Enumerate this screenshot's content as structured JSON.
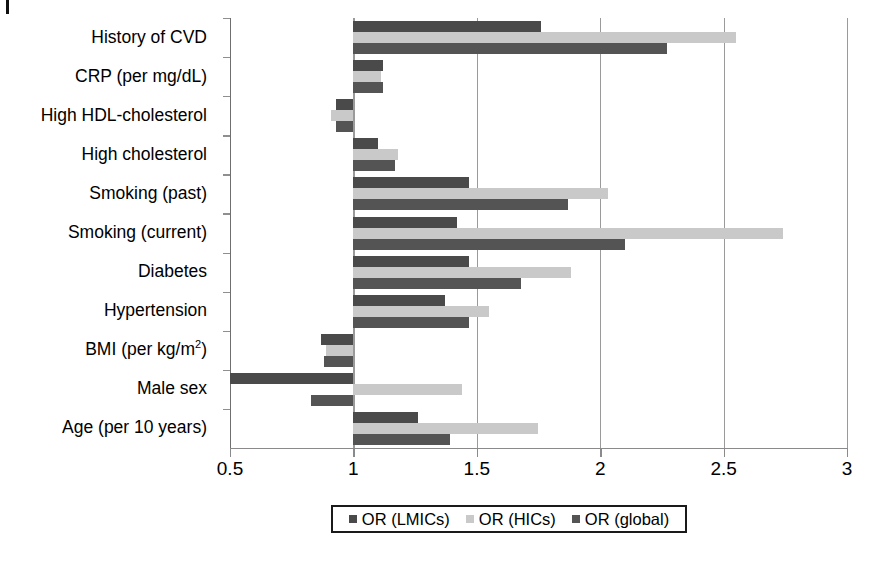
{
  "figure": {
    "corner_mark": "page-edge-mark"
  },
  "chart_data": {
    "type": "bar",
    "orientation": "horizontal",
    "title": "",
    "xlabel": "",
    "ylabel": "",
    "xlim": [
      0.5,
      3
    ],
    "xticks": [
      0.5,
      1,
      1.5,
      2,
      2.5,
      3
    ],
    "xtick_labels": [
      "0.5",
      "1",
      "1.5",
      "2",
      "2.5",
      "3"
    ],
    "reference_line": 1,
    "grid": "vertical",
    "legend_position": "bottom",
    "categories": [
      "History of CVD",
      "CRP (per mg/dL)",
      "High HDL-cholesterol",
      "High cholesterol",
      "Smoking (past)",
      "Smoking (current)",
      "Diabetes",
      "Hypertension",
      "BMI (per kg/m2)",
      "Male sex",
      "Age (per 10 years)"
    ],
    "series": [
      {
        "name": "OR (LMICs)",
        "color": "#4a4a4a",
        "values": [
          1.76,
          1.12,
          0.93,
          1.1,
          1.47,
          1.42,
          1.47,
          1.37,
          0.87,
          0.5,
          1.26
        ]
      },
      {
        "name": "OR (HICs)",
        "color": "#c9c9c9",
        "values": [
          2.55,
          1.11,
          0.91,
          1.18,
          2.03,
          2.74,
          1.88,
          1.55,
          0.89,
          1.44,
          1.75
        ]
      },
      {
        "name": "OR (global)",
        "color": "#545454",
        "values": [
          2.27,
          1.12,
          0.93,
          1.17,
          1.87,
          2.1,
          1.68,
          1.47,
          0.88,
          0.83,
          1.39
        ]
      }
    ]
  },
  "legend": {
    "items": [
      {
        "label": "OR (LMICs)",
        "swatch": "lmics"
      },
      {
        "label": "OR (HICs)",
        "swatch": "hics"
      },
      {
        "label": "OR (global)",
        "swatch": "global"
      }
    ]
  }
}
